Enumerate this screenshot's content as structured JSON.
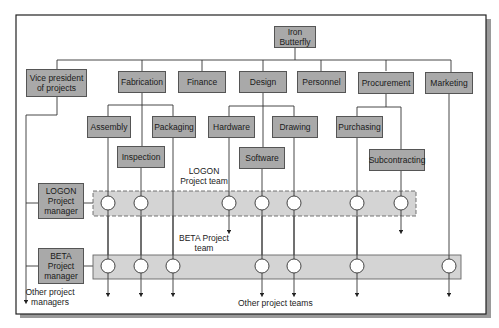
{
  "diagram": {
    "type": "matrix-organization-chart",
    "top": {
      "label": "Iron Butterfly"
    },
    "functional_units": [
      {
        "label": "Vice president of projects"
      },
      {
        "label": "Fabrication"
      },
      {
        "label": "Finance"
      },
      {
        "label": "Design"
      },
      {
        "label": "Personnel"
      },
      {
        "label": "Procurement"
      },
      {
        "label": "Marketing"
      }
    ],
    "sub_units": {
      "fabrication": [
        {
          "label": "Assembly"
        },
        {
          "label": "Inspection"
        },
        {
          "label": "Packaging"
        }
      ],
      "design": [
        {
          "label": "Hardware"
        },
        {
          "label": "Software"
        },
        {
          "label": "Drawing"
        }
      ],
      "procurement": [
        {
          "label": "Purchasing"
        },
        {
          "label": "Subcontracting"
        }
      ]
    },
    "project_managers": [
      {
        "label": "LOGON Project manager"
      },
      {
        "label": "BETA Project manager"
      }
    ],
    "project_teams": [
      {
        "label": "LOGON Project team",
        "style": "dashed",
        "members": 7
      },
      {
        "label": "BETA Project team",
        "style": "solid",
        "members": 7
      }
    ],
    "annotations": {
      "other_managers": "Other project managers",
      "other_teams": "Other project teams"
    },
    "colors": {
      "box_fill": "#a9a9a9",
      "band_fill": "#d4d4d4",
      "line": "#333333"
    }
  }
}
